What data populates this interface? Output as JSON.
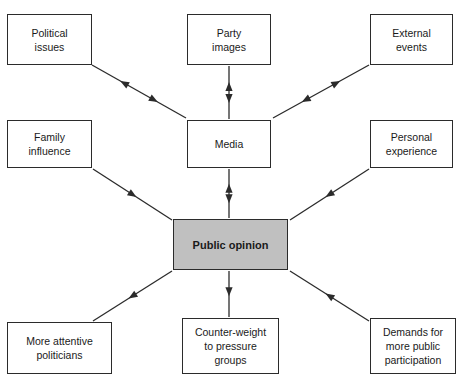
{
  "diagram": {
    "title": "",
    "type": "influence-flow-diagram",
    "canvas": {
      "width": 460,
      "height": 376,
      "background": "#ffffff"
    },
    "colors": {
      "node_fill": "#ffffff",
      "center_node_fill": "#c0c0c0",
      "stroke": "#2b2b2b",
      "text": "#1a1a1a"
    },
    "nodes": [
      {
        "id": "political-issues",
        "label": "Political\nissues",
        "x": 7,
        "y": 14,
        "w": 85,
        "h": 51,
        "fill": "#ffffff",
        "emphasis": false
      },
      {
        "id": "party-images",
        "label": "Party\nimages",
        "x": 187,
        "y": 14,
        "w": 84,
        "h": 51,
        "fill": "#ffffff",
        "emphasis": false
      },
      {
        "id": "external-events",
        "label": "External\nevents",
        "x": 370,
        "y": 14,
        "w": 83,
        "h": 51,
        "fill": "#ffffff",
        "emphasis": false
      },
      {
        "id": "family-influence",
        "label": "Family\ninfluence",
        "x": 7,
        "y": 120,
        "w": 85,
        "h": 48,
        "fill": "#ffffff",
        "emphasis": false
      },
      {
        "id": "media",
        "label": "Media",
        "x": 187,
        "y": 120,
        "w": 84,
        "h": 48,
        "fill": "#ffffff",
        "emphasis": false
      },
      {
        "id": "personal-experience",
        "label": "Personal\nexperience",
        "x": 370,
        "y": 120,
        "w": 83,
        "h": 48,
        "fill": "#ffffff",
        "emphasis": false
      },
      {
        "id": "public-opinion",
        "label": "Public opinion",
        "x": 173,
        "y": 219,
        "w": 115,
        "h": 51,
        "fill": "#c0c0c0",
        "emphasis": true
      },
      {
        "id": "more-attentive-politicians",
        "label": "More attentive\npoliticians",
        "x": 7,
        "y": 322,
        "w": 105,
        "h": 52,
        "fill": "#ffffff",
        "emphasis": false
      },
      {
        "id": "counter-weight",
        "label": "Counter-weight\nto pressure\ngroups",
        "x": 182,
        "y": 318,
        "w": 97,
        "h": 56,
        "fill": "#ffffff",
        "emphasis": false
      },
      {
        "id": "demands-more-public-participation",
        "label": "Demands for\nmore public\nparticipation",
        "x": 370,
        "y": 318,
        "w": 86,
        "h": 56,
        "fill": "#ffffff",
        "emphasis": false
      }
    ],
    "edges": [
      {
        "id": "edge-political-issues-media",
        "from": "political-issues",
        "to": "media",
        "direction": "bidirectional",
        "x1": 92,
        "y1": 65,
        "x2": 186,
        "y2": 118
      },
      {
        "id": "edge-party-images-media",
        "from": "party-images",
        "to": "media",
        "direction": "bidirectional",
        "x1": 229,
        "y1": 66,
        "x2": 229,
        "y2": 119
      },
      {
        "id": "edge-external-events-media",
        "from": "external-events",
        "to": "media",
        "direction": "bidirectional",
        "x1": 369,
        "y1": 65,
        "x2": 273,
        "y2": 118
      },
      {
        "id": "edge-family-influence-public-opinion",
        "from": "family-influence",
        "to": "public-opinion",
        "direction": "one-way",
        "x1": 93,
        "y1": 169,
        "x2": 172,
        "y2": 220
      },
      {
        "id": "edge-media-public-opinion",
        "from": "media",
        "to": "public-opinion",
        "direction": "bidirectional",
        "x1": 229,
        "y1": 169,
        "x2": 229,
        "y2": 218
      },
      {
        "id": "edge-personal-experience-public-opinion",
        "from": "personal-experience",
        "to": "public-opinion",
        "direction": "one-way",
        "x1": 369,
        "y1": 169,
        "x2": 290,
        "y2": 220
      },
      {
        "id": "edge-public-opinion-more-attentive-politicians",
        "from": "public-opinion",
        "to": "more-attentive-politicians",
        "direction": "one-way",
        "x1": 172,
        "y1": 271,
        "x2": 93,
        "y2": 321
      },
      {
        "id": "edge-public-opinion-counter-weight",
        "from": "public-opinion",
        "to": "counter-weight",
        "direction": "one-way",
        "x1": 229,
        "y1": 271,
        "x2": 229,
        "y2": 317
      },
      {
        "id": "edge-demands-public-opinion",
        "from": "demands-more-public-participation",
        "to": "public-opinion",
        "direction": "one-way",
        "x1": 369,
        "y1": 321,
        "x2": 290,
        "y2": 271
      }
    ]
  }
}
